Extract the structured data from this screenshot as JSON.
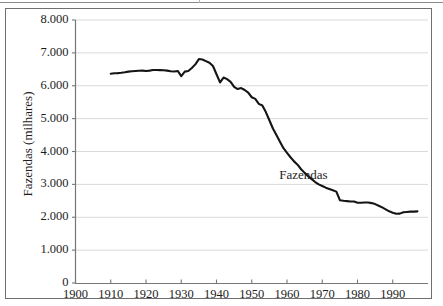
{
  "figure": {
    "background_color": "#ffffff",
    "frame_color": "#6f6f6f",
    "gridline_color": "#d9d9d9",
    "axis_color": "#777777",
    "series_color": "#151515",
    "text_color": "#1d1d1d"
  },
  "annotations": {
    "series_label": "Fazendas"
  },
  "chart_data": {
    "type": "line",
    "title": "",
    "subtitle": "",
    "xlabel": "",
    "ylabel": "Fazendas (milhares)",
    "xlim": [
      1900,
      2000
    ],
    "ylim": [
      0,
      8000
    ],
    "grid": true,
    "grid_axis": "y",
    "legend": "none",
    "annotations": [
      {
        "text": "Fazendas",
        "x": 1968,
        "y": 3300
      }
    ],
    "ytick_labels": [
      "0",
      "1.000",
      "2.000",
      "3.000",
      "4.000",
      "5.000",
      "6.000",
      "7.000",
      "8.000"
    ],
    "ytick_values": [
      0,
      1000,
      2000,
      3000,
      4000,
      5000,
      6000,
      7000,
      8000
    ],
    "xtick_labels": [
      "1900",
      "1910",
      "1920",
      "1930",
      "1940",
      "1950",
      "1960",
      "1970",
      "1980",
      "1990"
    ],
    "xtick_values": [
      1900,
      1910,
      1920,
      1930,
      1940,
      1950,
      1960,
      1970,
      1980,
      1990
    ],
    "series": [
      {
        "name": "Fazendas",
        "unit": "milhares",
        "x": [
          1910,
          1911,
          1912,
          1913,
          1914,
          1915,
          1916,
          1917,
          1918,
          1919,
          1920,
          1921,
          1922,
          1923,
          1924,
          1925,
          1926,
          1927,
          1928,
          1929,
          1930,
          1931,
          1932,
          1933,
          1934,
          1935,
          1936,
          1937,
          1938,
          1939,
          1940,
          1941,
          1942,
          1943,
          1944,
          1945,
          1946,
          1947,
          1948,
          1949,
          1950,
          1951,
          1952,
          1953,
          1954,
          1955,
          1956,
          1957,
          1958,
          1959,
          1960,
          1961,
          1962,
          1963,
          1964,
          1965,
          1966,
          1967,
          1968,
          1969,
          1970,
          1971,
          1972,
          1973,
          1974,
          1975,
          1976,
          1977,
          1978,
          1979,
          1980,
          1981,
          1982,
          1983,
          1984,
          1985,
          1986,
          1987,
          1988,
          1989,
          1990,
          1991,
          1992,
          1993,
          1994,
          1995,
          1996,
          1997
        ],
        "values": [
          6366,
          6380,
          6385,
          6395,
          6410,
          6430,
          6440,
          6450,
          6455,
          6460,
          6448,
          6460,
          6478,
          6480,
          6475,
          6471,
          6460,
          6440,
          6435,
          6450,
          6295,
          6430,
          6450,
          6540,
          6650,
          6812,
          6800,
          6750,
          6700,
          6600,
          6350,
          6100,
          6250,
          6200,
          6120,
          5967,
          5900,
          5930,
          5870,
          5790,
          5650,
          5600,
          5450,
          5400,
          5200,
          4950,
          4700,
          4500,
          4300,
          4100,
          3960,
          3825,
          3700,
          3600,
          3460,
          3350,
          3250,
          3160,
          3070,
          3000,
          2950,
          2900,
          2860,
          2820,
          2780,
          2520,
          2500,
          2490,
          2480,
          2480,
          2440,
          2440,
          2450,
          2450,
          2430,
          2400,
          2350,
          2300,
          2240,
          2180,
          2140,
          2105,
          2110,
          2150,
          2160,
          2170,
          2170,
          2180
        ]
      }
    ]
  }
}
